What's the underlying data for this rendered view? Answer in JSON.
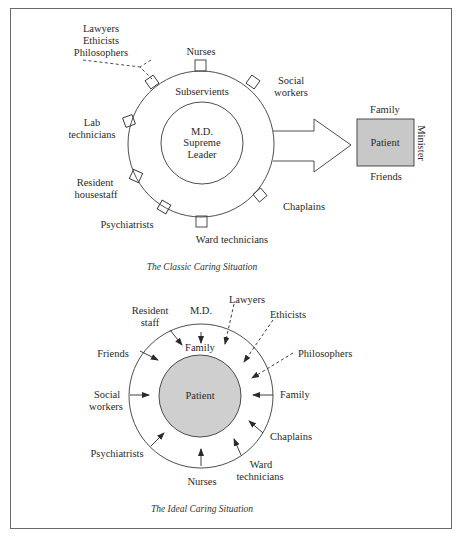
{
  "classic": {
    "caption": "The Classic Caring Situation",
    "center": {
      "line1": "M.D.",
      "line2": "Supreme",
      "line3": "Leader"
    },
    "ring_label": "Subservients",
    "outer_roles": {
      "lawyers_group": [
        "Lawyers",
        "Ethicists",
        "Philosophers"
      ],
      "nurses": "Nurses",
      "social_workers": [
        "Social",
        "workers"
      ],
      "lab_technicians": [
        "Lab",
        "technicians"
      ],
      "resident_housestaff": [
        "Resident",
        "housestaff"
      ],
      "psychiatrists": "Psychiatrists",
      "ward_technicians": "Ward technicians",
      "chaplains": "Chaplains"
    },
    "patient_box": {
      "label": "Patient",
      "top": "Family",
      "bottom": "Friends",
      "side": "Minister",
      "fill": "#c8c8c8"
    }
  },
  "ideal": {
    "caption": "The Ideal Caring Situation",
    "center": "Patient",
    "center_fill": "#cfcfcf",
    "inner_label": "Family",
    "arrows": {
      "resident_staff": [
        "Resident",
        "staff"
      ],
      "md": "M.D.",
      "lawyers": "Lawyers",
      "ethicists": "Ethicists",
      "philosophers": "Philosophers",
      "family": "Family",
      "chaplains": "Chaplains",
      "ward_technicians": [
        "Ward",
        "technicians"
      ],
      "nurses": "Nurses",
      "psychiatrists": "Psychiatrists",
      "social_workers": [
        "Social",
        "workers"
      ],
      "friends": "Friends"
    },
    "dashed_arrows": [
      "Lawyers",
      "Ethicists",
      "Philosophers"
    ]
  }
}
